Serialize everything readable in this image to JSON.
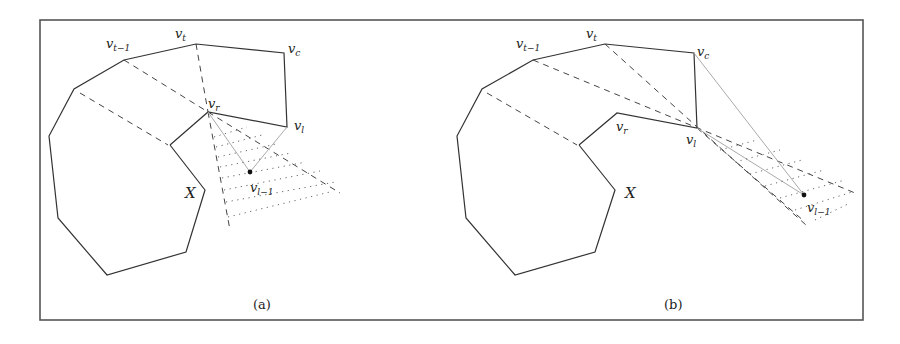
{
  "figure": {
    "panels": [
      {
        "id": "a",
        "caption": "(a)",
        "region_label": "X",
        "vertex_labels": {
          "v_t": {
            "base": "v",
            "sub": "t"
          },
          "v_t_minus_1": {
            "base": "v",
            "sub": "t−1"
          },
          "v_c": {
            "base": "v",
            "sub": "c"
          },
          "v_r": {
            "base": "v",
            "sub": "r"
          },
          "v_l": {
            "base": "v",
            "sub": "l"
          },
          "v_l_minus_1": {
            "base": "v",
            "sub": "l−1"
          }
        }
      },
      {
        "id": "b",
        "caption": "(b)",
        "region_label": "X",
        "vertex_labels": {
          "v_t": {
            "base": "v",
            "sub": "t"
          },
          "v_t_minus_1": {
            "base": "v",
            "sub": "t−1"
          },
          "v_c": {
            "base": "v",
            "sub": "c"
          },
          "v_r": {
            "base": "v",
            "sub": "r"
          },
          "v_l": {
            "base": "v",
            "sub": "l"
          },
          "v_l_minus_1": {
            "base": "v",
            "sub": "l−1"
          }
        }
      }
    ],
    "colors": {
      "frame": "#555555",
      "edge": "#333333",
      "dashed": "#444444",
      "gray_line": "#aaaaaa",
      "dotted": "#666666"
    }
  }
}
